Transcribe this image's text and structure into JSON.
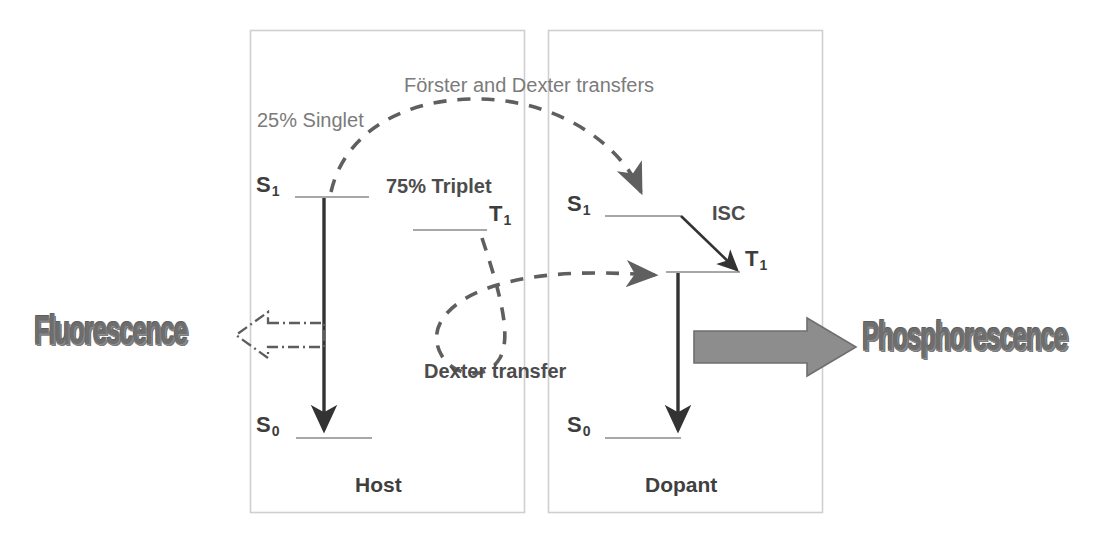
{
  "figure": {
    "type": "energy-level-diagram"
  },
  "colors": {
    "box_stroke": "#cfcfcf",
    "level_line": "#8a8a8a",
    "dark_arrow": "#333333",
    "dashed_curve": "#5f5f5f",
    "gray_block_arrow_fill": "#8d8d8d",
    "gray_block_arrow_stroke": "#6f6f6f",
    "label_gray": "#7b7b7b",
    "label_dark": "#4c4c4c",
    "wordart": "#6e6e6e",
    "background": "#ffffff"
  },
  "panels": [
    {
      "id": "host",
      "label": "Host"
    },
    {
      "id": "dopant",
      "label": "Dopant"
    }
  ],
  "host": {
    "box_label": "Host",
    "levels": [
      {
        "name": "S1",
        "label": "S",
        "sub": "1"
      },
      {
        "name": "T1",
        "label": "T",
        "sub": "1"
      },
      {
        "name": "S0",
        "label": "S",
        "sub": "0"
      }
    ],
    "annotations": [
      {
        "name": "singlet-fraction",
        "text": "25% Singlet"
      },
      {
        "name": "triplet-fraction",
        "text": "75% Triplet"
      }
    ],
    "emission": {
      "name": "fluorescence",
      "text": "Fluorescence"
    }
  },
  "dopant": {
    "box_label": "Dopant",
    "levels": [
      {
        "name": "S1",
        "label": "S",
        "sub": "1"
      },
      {
        "name": "T1",
        "label": "T",
        "sub": "1"
      },
      {
        "name": "S0",
        "label": "S",
        "sub": "0"
      }
    ],
    "annotations": [
      {
        "name": "intersystem-crossing",
        "text": "ISC"
      }
    ],
    "emission": {
      "name": "phosphorescence",
      "text": "Phosphorescence"
    }
  },
  "transfers": [
    {
      "name": "singlet-transfer",
      "text": "Förster and Dexter transfers"
    },
    {
      "name": "triplet-transfer",
      "text": "Dexter transfer"
    }
  ],
  "labels": {
    "forster_dexter": "Förster and Dexter transfers",
    "dexter": "Dexter transfer",
    "singlet_25": "25% Singlet",
    "triplet_75": "75% Triplet",
    "isc": "ISC",
    "host_box": "Host",
    "dopant_box": "Dopant",
    "fluorescence": "Fluorescence",
    "phosphorescence": "Phosphorescence",
    "s1": "S",
    "s1_sub": "1",
    "t1": "T",
    "t1_sub": "1",
    "s0": "S",
    "s0_sub": "0"
  }
}
